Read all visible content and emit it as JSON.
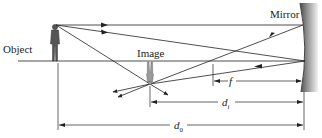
{
  "diagram": {
    "labels": {
      "object": "Object",
      "image": "Image",
      "mirror": "Mirror",
      "focal_length": "f",
      "image_distance_base": "d",
      "image_distance_sub": "i",
      "object_distance_base": "d",
      "object_distance_sub": "0"
    },
    "colors": {
      "line": "#222222",
      "mirror_dark": "#555555",
      "mirror_light": "#e6e6e6",
      "background": "#ffffff"
    }
  }
}
